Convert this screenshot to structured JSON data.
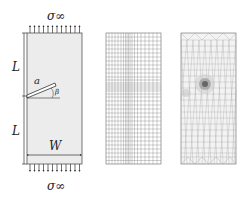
{
  "panel_geometry": {
    "stress_top": "σ∞",
    "stress_bottom": "σ∞",
    "length_upper": "L",
    "length_lower": "L",
    "width": "W",
    "crack_length": "a",
    "crack_angle": "β",
    "plate_fill": "#ececec"
  },
  "panel_structured_mesh": {
    "description": "structured rectangular grid mesh"
  },
  "panel_unstructured_mesh": {
    "description": "unstructured triangular mesh refined around crack tip"
  }
}
